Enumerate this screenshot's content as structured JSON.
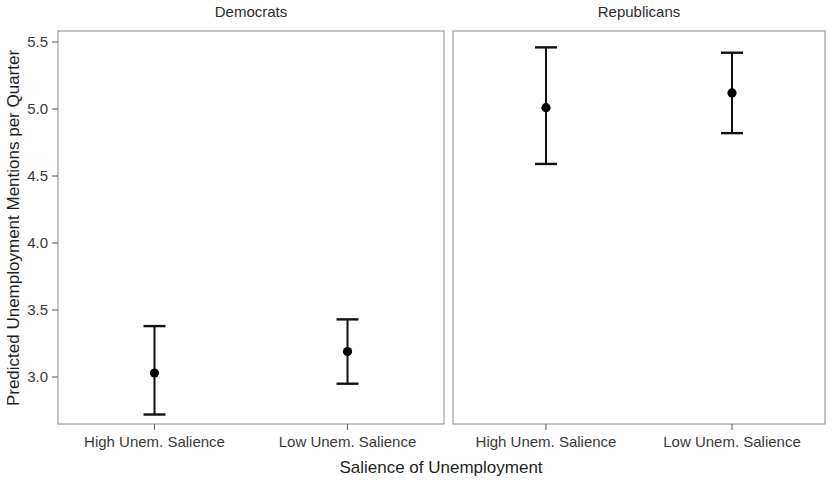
{
  "chart_data": {
    "type": "scatter",
    "title": "",
    "xlabel": "Salience of Unemployment",
    "ylabel": "Predicted Unemployment Mentions per Quarter",
    "ylim": [
      2.72,
      5.62
    ],
    "yticks": [
      3.0,
      3.5,
      4.0,
      4.5,
      5.0,
      5.5
    ],
    "ytick_labels": [
      "3.0",
      "3.5",
      "4.0",
      "4.5",
      "5.0",
      "5.5"
    ],
    "categories": [
      "High Unem. Salience",
      "Low Unem. Salience"
    ],
    "grid": false,
    "legend": false,
    "error_bars": "vertical with caps",
    "panels": [
      {
        "label": "Democrats",
        "points": [
          {
            "x": "High Unem. Salience",
            "y": 3.03,
            "ci_low": 2.72,
            "ci_high": 3.38
          },
          {
            "x": "Low Unem. Salience",
            "y": 3.19,
            "ci_low": 2.95,
            "ci_high": 3.43
          }
        ]
      },
      {
        "label": "Republicans",
        "points": [
          {
            "x": "High Unem. Salience",
            "y": 5.01,
            "ci_low": 4.59,
            "ci_high": 5.46
          },
          {
            "x": "Low Unem. Salience",
            "y": 5.12,
            "ci_low": 4.82,
            "ci_high": 5.42
          }
        ]
      }
    ],
    "colors": {
      "point": "#000000",
      "error_bar": "#111111",
      "panel_border": "#8a8a8a",
      "text": "#1f1f1f",
      "background": "#ffffff"
    }
  }
}
